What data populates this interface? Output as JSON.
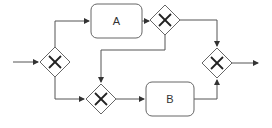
{
  "diagram": {
    "type": "BPMN process flow",
    "colors": {
      "stroke": "#555555",
      "fill": "#ffffff",
      "text": "#333333"
    },
    "tasks": [
      {
        "id": "A",
        "label": "A"
      },
      {
        "id": "B",
        "label": "B"
      }
    ],
    "gateways": [
      {
        "id": "g1",
        "kind": "exclusive",
        "icon": "x-icon",
        "role": "split"
      },
      {
        "id": "g2",
        "kind": "exclusive",
        "icon": "x-icon",
        "role": "split"
      },
      {
        "id": "g3",
        "kind": "exclusive",
        "icon": "x-icon",
        "role": "merge"
      },
      {
        "id": "g4",
        "kind": "exclusive",
        "icon": "x-icon",
        "role": "merge"
      }
    ],
    "flows": [
      {
        "from": "start",
        "to": "g1"
      },
      {
        "from": "g1",
        "to": "A"
      },
      {
        "from": "g1",
        "to": "g3"
      },
      {
        "from": "A",
        "to": "g2"
      },
      {
        "from": "g2",
        "to": "g4"
      },
      {
        "from": "g2",
        "to": "g3"
      },
      {
        "from": "g3",
        "to": "B"
      },
      {
        "from": "B",
        "to": "g4"
      },
      {
        "from": "g4",
        "to": "end"
      }
    ]
  }
}
